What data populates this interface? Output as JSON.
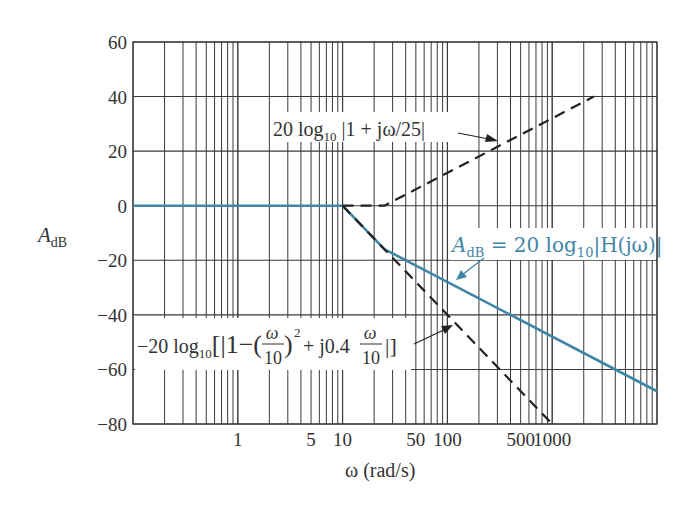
{
  "chart_data": {
    "type": "line",
    "title": "",
    "xlabel": "ω (rad/s)",
    "ylabel": "A_dB",
    "xscale": "log",
    "xlim": [
      0.1,
      10000
    ],
    "ylim": [
      -80,
      60
    ],
    "grid": true,
    "y_ticks": [
      60,
      40,
      20,
      0,
      -20,
      -40,
      -60,
      -80
    ],
    "y_tick_labels": [
      "60",
      "40",
      "20",
      "0",
      "−20",
      "−40",
      "−60",
      "−80"
    ],
    "x_tick_labels": [
      {
        "value": 1,
        "label": "1"
      },
      {
        "value": 5,
        "label": "5"
      },
      {
        "value": 10,
        "label": "10"
      },
      {
        "value": 50,
        "label": "50"
      },
      {
        "value": 100,
        "label": "100"
      },
      {
        "value": 500,
        "label": "500"
      },
      {
        "value": 1000,
        "label": "1000"
      }
    ],
    "series": [
      {
        "name": "A_dB = 20 log10|H(jω)|",
        "style": "solid",
        "color": "#3f86a6",
        "x": [
          0.1,
          10,
          25,
          10000
        ],
        "y": [
          0,
          0,
          -15.9,
          -68
        ]
      },
      {
        "name": "20 log10 |1 + jω/25|",
        "style": "dashed",
        "color": "#222222",
        "x": [
          10,
          25,
          2500
        ],
        "y": [
          0,
          0,
          40
        ]
      },
      {
        "name": "−20 log10[|1−(ω/10)² + j0.4 ω/10|]",
        "style": "dashed",
        "color": "#222222",
        "x": [
          10,
          1000
        ],
        "y": [
          0,
          -80
        ]
      }
    ],
    "annotations": [
      {
        "text": "20 log10 |1 + jω/25|",
        "arrow_to": [
          400,
          31
        ]
      },
      {
        "text": "A_dB = 20 log10|H(jω)|",
        "arrow_to": [
          140,
          -28
        ]
      },
      {
        "text": "−20 log10[|1−(ω/10)² + j0.4 ω/10|]",
        "arrow_to": [
          40,
          -24
        ]
      }
    ]
  },
  "labels": {
    "y_axis_main": "A",
    "y_axis_sub": "dB",
    "x_axis": "ω (rad/s)",
    "ann_zero_main": "20 log",
    "ann_zero_sub": "10",
    "ann_zero_rest": " |1 + jω/25|",
    "ann_h_a": "A",
    "ann_h_sub": "dB",
    "ann_h_mid": " = 20 log",
    "ann_h_sub2": "10",
    "ann_h_rest": "|H(jω)|",
    "ann_pole_pre": "−20 log",
    "ann_pole_sub": "10",
    "ann_pole_b1": "[|1−(",
    "ann_pole_frac_num": "ω",
    "ann_pole_frac_den": "10",
    "ann_pole_b2": ")",
    "ann_pole_sq": "2",
    "ann_pole_b3": "+ j0.4 ",
    "ann_pole_b4": "|]"
  },
  "colors": {
    "accent_blue": "#3f86a6",
    "grid": "#333333",
    "dashed": "#222222"
  }
}
